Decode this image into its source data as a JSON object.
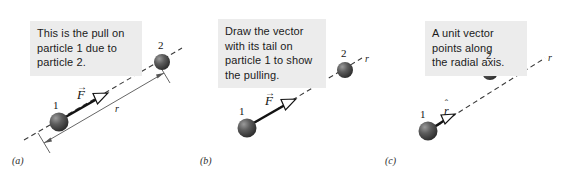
{
  "figure": {
    "background_color": "#ffffff",
    "callout_background": "#ececec",
    "particle_color": "#4a4a4a",
    "line_color": "#3a3a3a"
  },
  "panels": [
    {
      "id": "a",
      "label": "(a)",
      "callout_text": "This is the pull on\nparticle 1 due to\nparticle 2.",
      "particle_1_label": "1",
      "particle_2_label": "2",
      "vector_symbol": "F",
      "vector_accent": "→",
      "distance_label": "r",
      "has_distance_measure": true,
      "has_axis_label": false,
      "axis_label": ""
    },
    {
      "id": "b",
      "label": "(b)",
      "callout_text": "Draw the vector\nwith its tail on\nparticle 1 to show\nthe pulling.",
      "particle_1_label": "1",
      "particle_2_label": "2",
      "vector_symbol": "F",
      "vector_accent": "→",
      "distance_label": "",
      "has_distance_measure": false,
      "has_axis_label": true,
      "axis_label": "r"
    },
    {
      "id": "c",
      "label": "(c)",
      "callout_text": "A unit vector\npoints along\nthe radial axis.",
      "particle_1_label": "1",
      "particle_2_label": "2",
      "vector_symbol": "r",
      "vector_accent": "ˆ",
      "distance_label": "",
      "has_distance_measure": false,
      "has_axis_label": true,
      "axis_label": "r"
    }
  ]
}
